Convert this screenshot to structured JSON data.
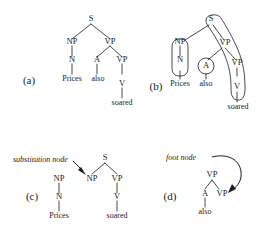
{
  "figure": {
    "ink_color": "#1a1a1a",
    "background_color": "#ffffff"
  },
  "panels": {
    "a": {
      "label": "(a)",
      "nodes": {
        "s": "S",
        "np": "NP",
        "vp": "VP",
        "n": "N",
        "a": "A",
        "vp2": "VP",
        "v": "V"
      },
      "leaves": {
        "prices": "Prices",
        "also": "also",
        "soared": "soared"
      }
    },
    "b": {
      "label": "(b)",
      "nodes": {
        "s": "S",
        "np": "NP",
        "vp": "VP",
        "n": "N",
        "a": "A",
        "vp2": "VP",
        "v": "V"
      },
      "leaves": {
        "prices": "Prices",
        "also": "also",
        "soared": "soared"
      }
    },
    "c": {
      "label": "(c)",
      "annotation": "substitution node",
      "left_tree": {
        "np": "NP",
        "n": "N",
        "prices": "Prices"
      },
      "right_tree": {
        "s": "S",
        "np": "NP",
        "vp": "VP",
        "v": "V",
        "soared": "soared"
      }
    },
    "d": {
      "label": "(d)",
      "annotation": "foot node",
      "tree": {
        "vp": "VP",
        "a": "A",
        "vp_foot": "VP",
        "also": "also"
      }
    }
  }
}
